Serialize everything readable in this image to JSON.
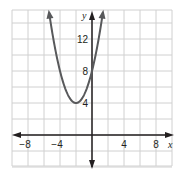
{
  "chart_data": {
    "type": "line",
    "title": "",
    "function": "y = (x + 2)^2 + 4",
    "vertex": [
      -2,
      4
    ],
    "y_intercept": 8,
    "xlabel": "x",
    "ylabel": "y",
    "x_ticks": [
      "−8",
      "−4",
      "4",
      "8"
    ],
    "x_tick_values": [
      -8,
      -4,
      4,
      8
    ],
    "y_ticks": [
      "4",
      "8",
      "12"
    ],
    "y_tick_values": [
      4,
      8,
      12
    ],
    "xlim": [
      -10,
      10
    ],
    "ylim": [
      -4,
      15.5
    ],
    "grid": true,
    "grid_step": 2,
    "points": [
      [
        -5.4,
        15.5
      ],
      [
        -5,
        13
      ],
      [
        -4,
        8
      ],
      [
        -3,
        5
      ],
      [
        -2,
        4
      ],
      [
        -1,
        5
      ],
      [
        0,
        8
      ],
      [
        1,
        13
      ],
      [
        1.4,
        15.5
      ]
    ],
    "colors": {
      "curve": "#58595b",
      "axis": "#231f20",
      "grid": "#d0d0d0"
    }
  }
}
